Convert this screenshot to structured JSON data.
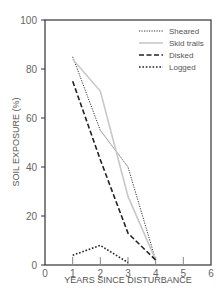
{
  "chart_data": {
    "type": "line",
    "title": "",
    "xlabel": "YEARS SINCE DISTURBANCE",
    "ylabel": "SOIL EXPOSURE (%)",
    "xlim": [
      0,
      6
    ],
    "ylim": [
      0,
      100
    ],
    "x_ticks": [
      "0",
      "1",
      "2",
      "3",
      "4",
      "5",
      "6"
    ],
    "y_ticks": [
      "0",
      "20",
      "40",
      "60",
      "80",
      "100"
    ],
    "grid": false,
    "legend_position": "upper right",
    "series": [
      {
        "name": "Sheared",
        "style": "dotted-fine",
        "color": "#333333",
        "x": [
          1,
          2,
          3,
          4
        ],
        "values": [
          85,
          55,
          40,
          2
        ]
      },
      {
        "name": "Skid trails",
        "style": "solid-light",
        "color": "#c8c8c8",
        "x": [
          1,
          2,
          3,
          4
        ],
        "values": [
          84,
          71,
          28,
          2
        ]
      },
      {
        "name": "Disked",
        "style": "dashed",
        "color": "#222222",
        "x": [
          1,
          2,
          3,
          4
        ],
        "values": [
          75,
          43,
          13,
          2
        ]
      },
      {
        "name": "Logged",
        "style": "dotted-heavy",
        "color": "#222222",
        "x": [
          1,
          2,
          3
        ],
        "values": [
          4,
          8,
          1
        ]
      }
    ]
  }
}
